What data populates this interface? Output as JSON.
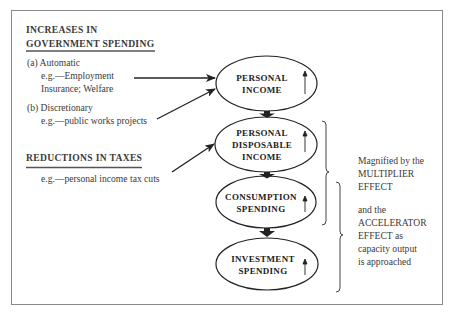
{
  "left_panel": {
    "gov_heading_line1": "INCREASES IN",
    "gov_heading_line2": "GOVERNMENT SPENDING",
    "automatic_label": "(a) Automatic",
    "automatic_example_line1": "e.g.—Employment",
    "automatic_example_line2": "Insurance; Welfare",
    "discretionary_label": "(b) Discretionary",
    "discretionary_example": "e.g.—public works projects",
    "tax_heading": "REDUCTIONS IN TAXES",
    "tax_example": "e.g.—personal income tax cuts"
  },
  "nodes": [
    {
      "id": "personal-income",
      "lines": [
        "PERSONAL",
        "INCOME"
      ],
      "indicator": "up-arrow"
    },
    {
      "id": "personal-disposable-income",
      "lines": [
        "PERSONAL",
        "DISPOSABLE",
        "INCOME"
      ],
      "indicator": "up-arrow"
    },
    {
      "id": "consumption-spending",
      "lines": [
        "CONSUMPTION",
        "SPENDING"
      ],
      "indicator": "up-arrow"
    },
    {
      "id": "investment-spending",
      "lines": [
        "INVESTMENT",
        "SPENDING"
      ],
      "indicator": "up-arrow"
    }
  ],
  "right_panel": {
    "multiplier_line1": "Magnified by the",
    "multiplier_line2": "MULTIPLIER",
    "multiplier_line3": "EFFECT",
    "accelerator_line1": "and the",
    "accelerator_line2": "ACCELERATOR",
    "accelerator_line3": "EFFECT as",
    "accelerator_line4": "capacity output",
    "accelerator_line5": "is approached"
  },
  "colors": {
    "ink": "#222222",
    "text": "#3a3a3a",
    "frame": "#8a8a8a",
    "background": "#ffffff"
  }
}
